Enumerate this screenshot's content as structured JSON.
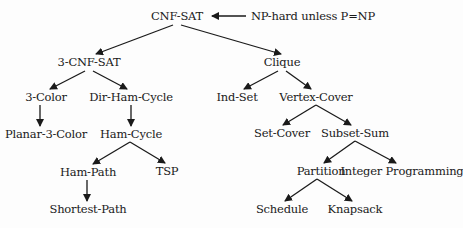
{
  "diagram": {
    "type": "reduction-tree",
    "nodes": [
      {
        "id": "cnf_sat",
        "label": "CNF-SAT",
        "x": 177,
        "y": 16
      },
      {
        "id": "three_cnf_sat",
        "label": "3-CNF-SAT",
        "x": 89,
        "y": 62
      },
      {
        "id": "clique",
        "label": "Clique",
        "x": 282,
        "y": 62
      },
      {
        "id": "three_color",
        "label": "3-Color",
        "x": 46,
        "y": 97
      },
      {
        "id": "dir_ham_cycle",
        "label": "Dir-Ham-Cycle",
        "x": 131,
        "y": 97
      },
      {
        "id": "ind_set",
        "label": "Ind-Set",
        "x": 237,
        "y": 97
      },
      {
        "id": "vertex_cover",
        "label": "Vertex-Cover",
        "x": 316,
        "y": 97
      },
      {
        "id": "planar_3_color",
        "label": "Planar-3-Color",
        "x": 46,
        "y": 134
      },
      {
        "id": "ham_cycle",
        "label": "Ham-Cycle",
        "x": 131,
        "y": 134
      },
      {
        "id": "set_cover",
        "label": "Set-Cover",
        "x": 282,
        "y": 133
      },
      {
        "id": "subset_sum",
        "label": "Subset-Sum",
        "x": 355,
        "y": 133
      },
      {
        "id": "ham_path",
        "label": "Ham-Path",
        "x": 88,
        "y": 172
      },
      {
        "id": "tsp",
        "label": "TSP",
        "x": 167,
        "y": 171
      },
      {
        "id": "partition",
        "label": "Partition",
        "x": 321,
        "y": 171
      },
      {
        "id": "integer_programming",
        "label": "Integer Programming",
        "x": 402,
        "y": 171
      },
      {
        "id": "shortest_path",
        "label": "Shortest-Path",
        "x": 88,
        "y": 209
      },
      {
        "id": "schedule",
        "label": "Schedule",
        "x": 282,
        "y": 209
      },
      {
        "id": "knapsack",
        "label": "Knapsack",
        "x": 355,
        "y": 209
      }
    ],
    "edges": [
      {
        "x1": 173,
        "y1": 25,
        "x2": 96,
        "y2": 54
      },
      {
        "x1": 181,
        "y1": 25,
        "x2": 281,
        "y2": 54
      },
      {
        "x1": 85,
        "y1": 71,
        "x2": 50,
        "y2": 89
      },
      {
        "x1": 93,
        "y1": 71,
        "x2": 127,
        "y2": 89
      },
      {
        "x1": 278,
        "y1": 71,
        "x2": 244,
        "y2": 89
      },
      {
        "x1": 286,
        "y1": 71,
        "x2": 311,
        "y2": 89
      },
      {
        "x1": 40,
        "y1": 105,
        "x2": 40,
        "y2": 126
      },
      {
        "x1": 131,
        "y1": 105,
        "x2": 131,
        "y2": 126
      },
      {
        "x1": 316,
        "y1": 105,
        "x2": 283,
        "y2": 125
      },
      {
        "x1": 316,
        "y1": 105,
        "x2": 351,
        "y2": 125
      },
      {
        "x1": 130,
        "y1": 142,
        "x2": 93,
        "y2": 164
      },
      {
        "x1": 130,
        "y1": 142,
        "x2": 165,
        "y2": 163
      },
      {
        "x1": 355,
        "y1": 141,
        "x2": 324,
        "y2": 163
      },
      {
        "x1": 355,
        "y1": 141,
        "x2": 396,
        "y2": 163
      },
      {
        "x1": 87,
        "y1": 180,
        "x2": 87,
        "y2": 201
      },
      {
        "x1": 317,
        "y1": 179,
        "x2": 285,
        "y2": 201
      },
      {
        "x1": 317,
        "y1": 179,
        "x2": 352,
        "y2": 201
      }
    ],
    "annotation": {
      "label": "NP-hard unless P=NP",
      "x": 251,
      "y": 16,
      "arrow": {
        "x1": 246,
        "y1": 16,
        "x2": 212,
        "y2": 16
      }
    },
    "colors": {
      "line": "#1a1a1a",
      "text": "#1a1a1a",
      "background": "#fdfdfd"
    }
  }
}
